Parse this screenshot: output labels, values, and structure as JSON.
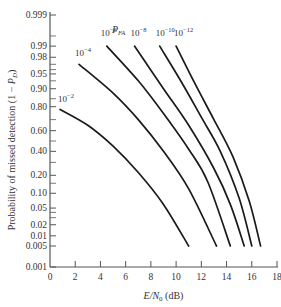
{
  "chart_data": {
    "type": "line",
    "title": "",
    "xlabel": "E/N0 (dB)",
    "ylabel": "Probability of missed detection (1 − P_D)",
    "xlim": [
      0,
      18
    ],
    "x_ticks": [
      0,
      2,
      4,
      6,
      8,
      10,
      12,
      14,
      16,
      18
    ],
    "y_scale": "normal-probability",
    "y_ticks": [
      "0.999",
      "0.99",
      "0.98",
      "0.95",
      "0.90",
      "0.80",
      "0.60",
      "0.40",
      "0.20",
      "0.10",
      "0.05",
      "0.02",
      "0.01",
      "0.005",
      "0.001"
    ],
    "legend_title": "P_FA",
    "grid": false,
    "series": [
      {
        "name": "10^-2",
        "label": "10",
        "exp": "−2",
        "x": [
          0.8,
          3,
          5,
          7,
          9,
          11
        ],
        "y": [
          0.78,
          0.65,
          0.45,
          0.22,
          0.06,
          0.005
        ]
      },
      {
        "name": "10^-4",
        "label": "10",
        "exp": "−4",
        "x": [
          2.3,
          5,
          7,
          9,
          11,
          13.2
        ],
        "y": [
          0.97,
          0.88,
          0.7,
          0.4,
          0.12,
          0.005
        ]
      },
      {
        "name": "10^-6",
        "label": "10",
        "exp": "−6",
        "x": [
          4.5,
          7,
          9,
          11,
          12.5,
          14.3
        ],
        "y": [
          0.99,
          0.93,
          0.75,
          0.42,
          0.16,
          0.005
        ]
      },
      {
        "name": "10^-8",
        "label": "10",
        "exp": "−8",
        "x": [
          6.7,
          9,
          11,
          13,
          14.3,
          15.4
        ],
        "y": [
          0.99,
          0.9,
          0.65,
          0.25,
          0.06,
          0.005
        ]
      },
      {
        "name": "10^-10",
        "label": "10",
        "exp": "−10",
        "x": [
          8.7,
          10.5,
          12,
          13.5,
          15,
          16.0
        ],
        "y": [
          0.99,
          0.92,
          0.72,
          0.4,
          0.08,
          0.005
        ]
      },
      {
        "name": "10^-12",
        "label": "10",
        "exp": "−12",
        "x": [
          10.0,
          11.5,
          13,
          14.5,
          15.8,
          16.7
        ],
        "y": [
          0.99,
          0.92,
          0.7,
          0.35,
          0.07,
          0.005
        ]
      }
    ]
  }
}
